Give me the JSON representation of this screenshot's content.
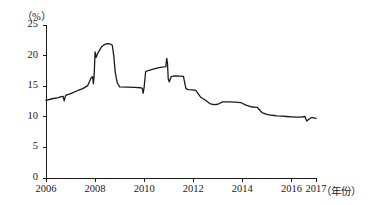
{
  "chart_data": {
    "type": "line",
    "title": "",
    "subtitle": "",
    "xlabel": "（年份）",
    "ylabel": "（%）",
    "xlim": [
      2006,
      2017
    ],
    "ylim": [
      0,
      25
    ],
    "grid": false,
    "legend": null,
    "y_ticks": [
      0,
      5,
      10,
      15,
      20,
      25
    ],
    "y_tick_labels": [
      "0",
      "5",
      "10",
      "15",
      "20",
      "25"
    ],
    "x_ticks": [
      2006,
      2008,
      2010,
      2012,
      2014,
      2016,
      2017
    ],
    "x_tick_labels": [
      "2006",
      "2008",
      "2010",
      "2012",
      "2014",
      "2016",
      "2017"
    ],
    "series": [
      {
        "name": "ratio",
        "color": "#1a1a1a",
        "x": [
          2006.0,
          2006.25,
          2006.5,
          2006.62,
          2006.7,
          2006.74,
          2006.8,
          2006.95,
          2007.1,
          2007.3,
          2007.5,
          2007.7,
          2007.85,
          2007.9,
          2007.93,
          2007.96,
          2008.0,
          2008.04,
          2008.1,
          2008.18,
          2008.28,
          2008.4,
          2008.5,
          2008.62,
          2008.7,
          2008.76,
          2008.82,
          2008.9,
          2009.0,
          2009.3,
          2009.6,
          2009.85,
          2009.92,
          2009.96,
          2010.0,
          2010.06,
          2010.2,
          2010.4,
          2010.6,
          2010.8,
          2010.88,
          2010.92,
          2010.95,
          2010.98,
          2011.02,
          2011.1,
          2011.25,
          2011.45,
          2011.6,
          2011.7,
          2011.8,
          2011.95,
          2012.1,
          2012.3,
          2012.5,
          2012.7,
          2012.85,
          2013.0,
          2013.2,
          2013.45,
          2013.7,
          2013.95,
          2014.15,
          2014.4,
          2014.6,
          2014.8,
          2015.0,
          2015.2,
          2015.4,
          2015.6,
          2015.8,
          2016.0,
          2016.2,
          2016.4,
          2016.55,
          2016.62,
          2016.7,
          2016.82,
          2016.95,
          2017.0
        ],
        "y": [
          12.7,
          12.95,
          13.15,
          13.3,
          13.35,
          12.6,
          13.5,
          13.7,
          13.95,
          14.3,
          14.6,
          15.1,
          16.45,
          16.55,
          15.4,
          16.6,
          20.6,
          19.7,
          20.3,
          20.9,
          21.5,
          21.85,
          21.95,
          21.9,
          21.7,
          20.0,
          17.3,
          15.6,
          14.9,
          14.85,
          14.8,
          14.75,
          14.65,
          13.85,
          14.9,
          17.4,
          17.6,
          17.85,
          18.05,
          18.15,
          18.2,
          19.55,
          18.7,
          16.2,
          15.7,
          16.55,
          16.7,
          16.65,
          16.6,
          14.6,
          14.45,
          14.4,
          14.3,
          13.2,
          12.7,
          12.1,
          12.0,
          12.05,
          12.45,
          12.45,
          12.4,
          12.3,
          11.9,
          11.6,
          11.55,
          10.7,
          10.4,
          10.25,
          10.15,
          10.1,
          10.05,
          10.0,
          9.95,
          9.95,
          10.05,
          9.3,
          9.55,
          9.9,
          9.8,
          9.75
        ]
      }
    ]
  }
}
